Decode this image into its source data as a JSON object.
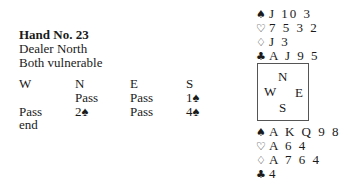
{
  "hand": {
    "title": "Hand No. 23",
    "dealer": "Dealer North",
    "vulnerability": "Both vulnerable"
  },
  "auction": {
    "headers": [
      "W",
      "N",
      "E",
      "S"
    ],
    "rows": [
      [
        "",
        "Pass",
        "Pass",
        "1♠"
      ],
      [
        "Pass",
        "2♠",
        "Pass",
        "4♠"
      ],
      [
        "end",
        "",
        "",
        ""
      ]
    ]
  },
  "north": {
    "spades": {
      "symbol": "♠",
      "cards": "J 10 3"
    },
    "hearts": {
      "symbol": "♡",
      "cards": "7 5 3 2"
    },
    "diamonds": {
      "symbol": "♢",
      "cards": "J 3"
    },
    "clubs": {
      "symbol": "♣",
      "cards": "A J 9 5"
    }
  },
  "compass": {
    "n": "N",
    "w": "W",
    "e": "E",
    "s": "S"
  },
  "south": {
    "spades": {
      "symbol": "♠",
      "cards": "A K Q 9 8"
    },
    "hearts": {
      "symbol": "♡",
      "cards": "A 6 4"
    },
    "diamonds": {
      "symbol": "♢",
      "cards": "A 7 6 4"
    },
    "clubs": {
      "symbol": "♣",
      "cards": "4"
    }
  }
}
